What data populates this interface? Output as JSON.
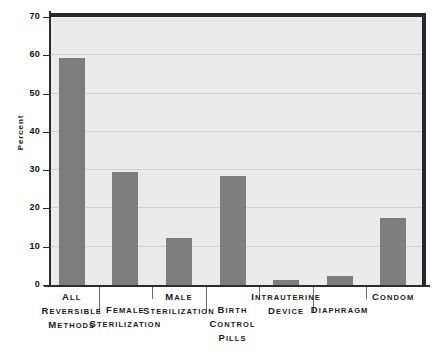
{
  "chart_data": {
    "type": "bar",
    "title": "",
    "xlabel": "",
    "ylabel": "Percent",
    "ylim": [
      0,
      70
    ],
    "yticks": [
      0,
      10,
      20,
      30,
      40,
      50,
      60,
      70
    ],
    "grid": true,
    "legend": "none",
    "bar_color": "#7d7d7d",
    "plot_background": "#eaeaea",
    "axis_color": "#26282b",
    "categories": [
      "All reversible methods",
      "Female sterilization",
      "Male sterilization",
      "Birth control pills",
      "Intrauterine device",
      "Diaphragm",
      "Condom"
    ],
    "category_label_lines": [
      [
        "All",
        "reversible",
        "methods"
      ],
      [
        "Female",
        "sterilization"
      ],
      [
        "Male",
        "sterilization"
      ],
      [
        "Birth",
        "control",
        "pills"
      ],
      [
        "Intrauterine",
        "device"
      ],
      [
        "Diaphragm"
      ],
      [
        "Condom"
      ]
    ],
    "values": [
      59.2,
      29.5,
      12.3,
      28.6,
      1.3,
      2.4,
      17.6
    ]
  },
  "axis": {
    "y_title": "Percent",
    "tick_labels": [
      "70",
      "60",
      "50",
      "40",
      "30",
      "20",
      "10",
      "0"
    ]
  }
}
